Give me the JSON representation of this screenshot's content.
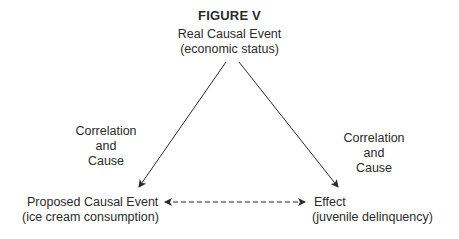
{
  "figure": {
    "title": "FIGURE V",
    "top_node": {
      "line1": "Real Causal Event",
      "line2": "(economic status)"
    },
    "left_node": {
      "line1": "Proposed Causal Event",
      "line2": "(ice cream consumption)"
    },
    "right_node": {
      "line1": "Effect",
      "line2": "(juvenile delinquency)"
    },
    "left_edge_label": {
      "line1": "Correlation",
      "line2": "and",
      "line3": "Cause"
    },
    "right_edge_label": {
      "line1": "Correlation",
      "line2": "and",
      "line3": "Cause"
    },
    "edges": [
      {
        "from": "top_node",
        "to": "left_node",
        "style": "solid",
        "arrow": "end"
      },
      {
        "from": "top_node",
        "to": "right_node",
        "style": "solid",
        "arrow": "end"
      },
      {
        "from": "left_node",
        "to": "right_node",
        "style": "dashed",
        "arrow": "both"
      }
    ]
  }
}
